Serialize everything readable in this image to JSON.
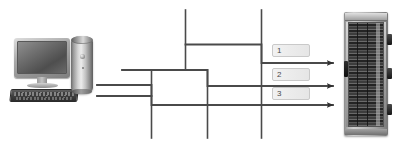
{
  "diagram": {
    "background_color": "#ffffff",
    "line_color": "#4a4a4a",
    "callout_text_color": "#4a4a4a",
    "callout_border_color": "#c9c9c9"
  },
  "source_device": {
    "name": "desktop-computer",
    "parts": {
      "monitor": "monitor",
      "keyboard": "keyboard",
      "tower": "tower"
    }
  },
  "target_device": {
    "name": "server-rack",
    "label": "server-rack-cabinet"
  },
  "callouts": [
    {
      "id": "1",
      "label": "1"
    },
    {
      "id": "2",
      "label": "2"
    },
    {
      "id": "3",
      "label": "3"
    }
  ],
  "connections": [
    {
      "id": "cable-1",
      "callout": "1",
      "from": "computer",
      "to": "server-rack"
    },
    {
      "id": "cable-2",
      "callout": "2",
      "from": "computer",
      "to": "server-rack"
    },
    {
      "id": "cable-3",
      "callout": "3",
      "from": "computer",
      "to": "server-rack"
    }
  ]
}
